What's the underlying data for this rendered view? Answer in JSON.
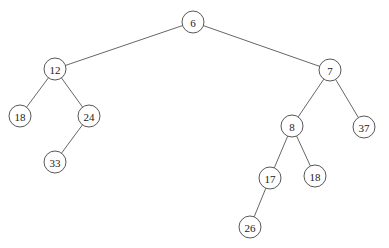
{
  "figure": {
    "kind": "binary-tree-diagram",
    "background_color": "#ffffff",
    "node_fill_color": "#ffffff",
    "node_stroke_color": "#444444",
    "edge_stroke_color": "#555555",
    "label_color": "#1a1a1a",
    "width": 389,
    "height": 248
  },
  "nodes": [
    {
      "id": "n0",
      "label": "6",
      "cx": 193,
      "cy": 22,
      "r": 11
    },
    {
      "id": "n1",
      "label": "12",
      "cx": 55,
      "cy": 69,
      "r": 11
    },
    {
      "id": "n2",
      "label": "7",
      "cx": 330,
      "cy": 70,
      "r": 11
    },
    {
      "id": "n3",
      "label": "18",
      "cx": 20,
      "cy": 116,
      "r": 11
    },
    {
      "id": "n4",
      "label": "24",
      "cx": 89,
      "cy": 116,
      "r": 11
    },
    {
      "id": "n5",
      "label": "8",
      "cx": 292,
      "cy": 126,
      "r": 11
    },
    {
      "id": "n6",
      "label": "37",
      "cx": 364,
      "cy": 127,
      "r": 11
    },
    {
      "id": "n7",
      "label": "33",
      "cx": 55,
      "cy": 162,
      "r": 11
    },
    {
      "id": "n8",
      "label": "17",
      "cx": 270,
      "cy": 178,
      "r": 11
    },
    {
      "id": "n9",
      "label": "18",
      "cx": 315,
      "cy": 176,
      "r": 11
    },
    {
      "id": "n10",
      "label": "26",
      "cx": 250,
      "cy": 227,
      "r": 11
    }
  ],
  "edges": [
    {
      "id": "e0",
      "from": "n0",
      "to": "n1",
      "from_label": "6",
      "to_label": "12",
      "side": "left"
    },
    {
      "id": "e1",
      "from": "n0",
      "to": "n2",
      "from_label": "6",
      "to_label": "7",
      "side": "right"
    },
    {
      "id": "e2",
      "from": "n1",
      "to": "n3",
      "from_label": "12",
      "to_label": "18",
      "side": "left"
    },
    {
      "id": "e3",
      "from": "n1",
      "to": "n4",
      "from_label": "12",
      "to_label": "24",
      "side": "right"
    },
    {
      "id": "e4",
      "from": "n4",
      "to": "n7",
      "from_label": "24",
      "to_label": "33",
      "side": "left"
    },
    {
      "id": "e5",
      "from": "n2",
      "to": "n5",
      "from_label": "7",
      "to_label": "8",
      "side": "left"
    },
    {
      "id": "e6",
      "from": "n2",
      "to": "n6",
      "from_label": "7",
      "to_label": "37",
      "side": "right"
    },
    {
      "id": "e7",
      "from": "n5",
      "to": "n8",
      "from_label": "8",
      "to_label": "17",
      "side": "left"
    },
    {
      "id": "e8",
      "from": "n5",
      "to": "n9",
      "from_label": "8",
      "to_label": "18",
      "side": "right"
    },
    {
      "id": "e9",
      "from": "n8",
      "to": "n10",
      "from_label": "17",
      "to_label": "26",
      "side": "left"
    }
  ]
}
